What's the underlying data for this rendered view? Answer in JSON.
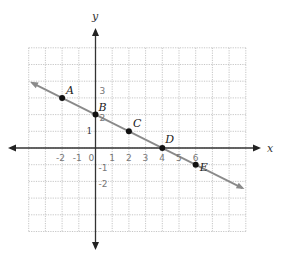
{
  "diagram": {
    "type": "coordinate-plane-line",
    "axes": {
      "x_label": "x",
      "y_label": "y"
    },
    "grid": {
      "x_min": -4,
      "x_max": 9,
      "y_min": -5,
      "y_max": 6,
      "cell_px": 16.7
    },
    "points": [
      {
        "label": "A",
        "x": -2,
        "y": 3
      },
      {
        "label": "B",
        "x": 0,
        "y": 2
      },
      {
        "label": "C",
        "x": 2,
        "y": 1
      },
      {
        "label": "D",
        "x": 4,
        "y": 0
      },
      {
        "label": "E",
        "x": 6,
        "y": -1
      }
    ],
    "printed_ticks": [
      {
        "axis": "y",
        "value": "1"
      }
    ],
    "handwritten_x_ticks": [
      "-2",
      "-1",
      "0",
      "1",
      "2",
      "3",
      "4",
      "5",
      "6"
    ],
    "handwritten_y_ticks": [
      "3",
      "2",
      "-1",
      "-2"
    ],
    "line_color": "#8a8a8a",
    "point_color": "#111111"
  }
}
